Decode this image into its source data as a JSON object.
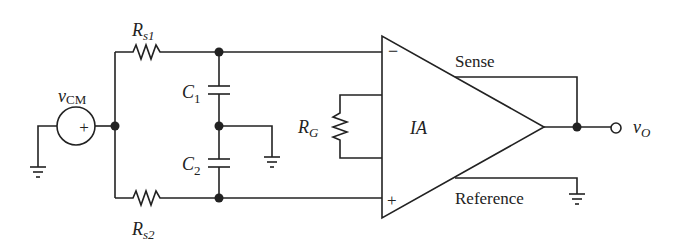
{
  "diagram": {
    "type": "circuit-schematic",
    "colors": {
      "stroke": "#222222",
      "background": "#ffffff"
    },
    "source": {
      "label_main": "v",
      "label_sub": "CM",
      "polarity": "+"
    },
    "resistors": {
      "rs1": {
        "main": "R",
        "sub": "s1"
      },
      "rs2": {
        "main": "R",
        "sub": "s2"
      },
      "rg": {
        "main": "R",
        "sub": "G"
      }
    },
    "capacitors": {
      "c1": {
        "main": "C",
        "sub": "1"
      },
      "c2": {
        "main": "C",
        "sub": "2"
      }
    },
    "amplifier": {
      "label": "IA",
      "inverting_input": "−",
      "noninverting_input": "+",
      "sense_label": "Sense",
      "reference_label": "Reference"
    },
    "output": {
      "label_main": "v",
      "label_sub": "O"
    }
  }
}
